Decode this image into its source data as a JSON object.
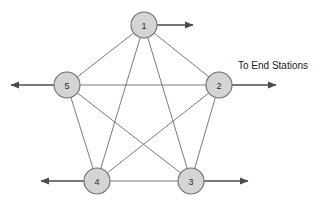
{
  "diagram": {
    "type": "network-topology",
    "title": "",
    "caption": {
      "text": "To End Stations",
      "x": 238,
      "y": 60
    },
    "colors": {
      "node_fill": "#d4d4d4",
      "node_stroke": "#6e6e6e",
      "edge_stroke": "#6b6b6b",
      "trunk_stroke": "#4a4a4a",
      "label_color": "#2a2a2a",
      "background": "#ffffff"
    },
    "nodes": [
      {
        "id": "1",
        "label": "1",
        "cx": 144,
        "cy": 25,
        "r": 13
      },
      {
        "id": "2",
        "label": "2",
        "cx": 219,
        "cy": 85,
        "r": 13
      },
      {
        "id": "3",
        "label": "3",
        "cx": 191,
        "cy": 181,
        "r": 13
      },
      {
        "id": "4",
        "label": "4",
        "cx": 97,
        "cy": 181,
        "r": 13
      },
      {
        "id": "5",
        "label": "5",
        "cx": 67,
        "cy": 85,
        "r": 13
      }
    ],
    "edges": [
      {
        "from": "1",
        "to": "2"
      },
      {
        "from": "1",
        "to": "3"
      },
      {
        "from": "1",
        "to": "4"
      },
      {
        "from": "1",
        "to": "5"
      },
      {
        "from": "2",
        "to": "3"
      },
      {
        "from": "2",
        "to": "4"
      },
      {
        "from": "2",
        "to": "5"
      },
      {
        "from": "3",
        "to": "4"
      },
      {
        "from": "3",
        "to": "5"
      },
      {
        "from": "4",
        "to": "5"
      }
    ],
    "trunks": [
      {
        "id": "trunk-node-1-right",
        "from_node": "1",
        "x1": 157,
        "y1": 25,
        "x2": 193,
        "y2": 25,
        "direction": "right"
      },
      {
        "id": "trunk-node-2-right",
        "from_node": "2",
        "x1": 232,
        "y1": 85,
        "x2": 276,
        "y2": 85,
        "direction": "right"
      },
      {
        "id": "trunk-node-5-left",
        "from_node": "5",
        "x1": 54,
        "y1": 85,
        "x2": 11,
        "y2": 85,
        "direction": "left"
      },
      {
        "id": "trunk-node-3-right",
        "from_node": "3",
        "x1": 204,
        "y1": 181,
        "x2": 248,
        "y2": 181,
        "direction": "right"
      },
      {
        "id": "trunk-node-4-left",
        "from_node": "4",
        "x1": 84,
        "y1": 181,
        "x2": 41,
        "y2": 181,
        "direction": "left"
      }
    ]
  }
}
